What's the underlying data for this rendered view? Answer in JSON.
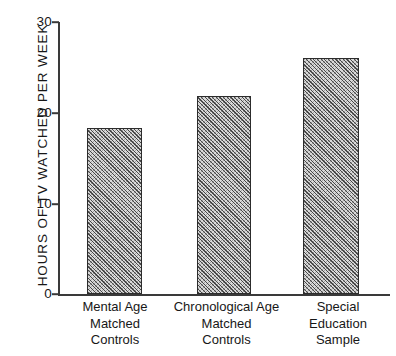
{
  "chart_data": {
    "type": "bar",
    "title": "",
    "subtitle": "",
    "xlabel": "",
    "ylabel": "HOURS OF TV WATCHED PER WEEK",
    "categories": [
      "Mental Age Matched Controls",
      "Chronological Age Matched Controls",
      "Special Education Sample"
    ],
    "category_lines": [
      [
        "Mental Age",
        "Matched",
        "Controls"
      ],
      [
        "Chronological  Age",
        "Matched",
        "Controls"
      ],
      [
        "Special",
        "Education",
        "Sample"
      ]
    ],
    "values": [
      18.3,
      21.8,
      26.0
    ],
    "ylim": [
      0,
      30
    ],
    "yticks": [
      0,
      10,
      20,
      30
    ],
    "ytick_labels": [
      "0",
      "10",
      "20",
      "30"
    ],
    "grid": false,
    "legend": false,
    "legend_position": "none",
    "bar_fill": "hatched-gray",
    "bar_edge_color": "#2c2c2c",
    "axis_color": "#3a3a3a",
    "text_color": "#171717",
    "background_color": "#ffffff"
  }
}
